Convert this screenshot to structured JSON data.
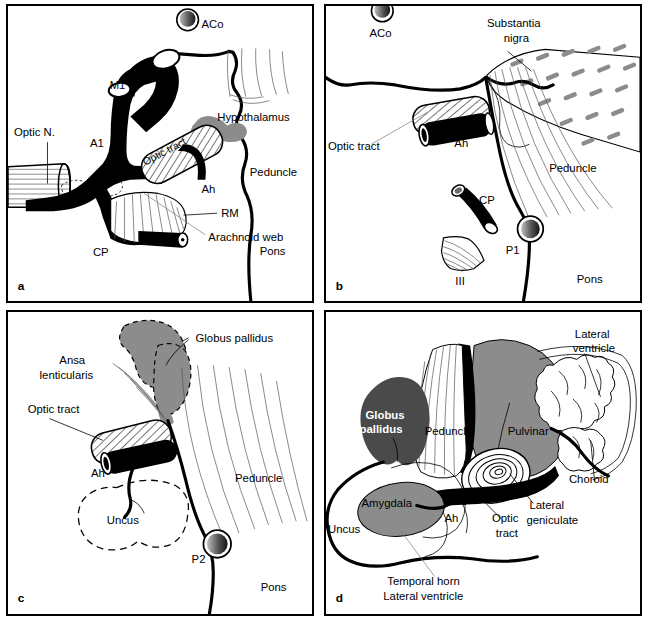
{
  "figure": {
    "type": "anatomical-line-diagram",
    "panel_count": 4,
    "colors": {
      "outline": "#000000",
      "gray_fill": "#8c8c8c",
      "dark_gray_fill": "#4a4a4a",
      "white_fill": "#ffffff",
      "background": "#ffffff"
    }
  },
  "panels": [
    {
      "letter": "a",
      "labels": [
        {
          "key": "aco",
          "text": "ACo"
        },
        {
          "key": "m1",
          "text": "M1"
        },
        {
          "key": "a1",
          "text": "A1"
        },
        {
          "key": "optic_n",
          "text": "Optic N."
        },
        {
          "key": "optic_tract",
          "text": "Optic tract"
        },
        {
          "key": "hypothalamus",
          "text": "Hypothalamus"
        },
        {
          "key": "ah",
          "text": "Ah"
        },
        {
          "key": "peduncle",
          "text": "Peduncle"
        },
        {
          "key": "rm",
          "text": "RM"
        },
        {
          "key": "arachnoid_web",
          "text": "Arachnoid web"
        },
        {
          "key": "cp",
          "text": "CP"
        },
        {
          "key": "pons",
          "text": "Pons"
        }
      ]
    },
    {
      "letter": "b",
      "labels": [
        {
          "key": "aco",
          "text": "ACo"
        },
        {
          "key": "substantia_nigra",
          "text": "Substantia\nnigra"
        },
        {
          "key": "substantia_l1",
          "text": "Substantia"
        },
        {
          "key": "substantia_l2",
          "text": "nigra"
        },
        {
          "key": "optic_tract",
          "text": "Optic tract"
        },
        {
          "key": "ah",
          "text": "Ah"
        },
        {
          "key": "peduncle",
          "text": "Peduncle"
        },
        {
          "key": "cp",
          "text": "CP"
        },
        {
          "key": "p1",
          "text": "P1"
        },
        {
          "key": "iii",
          "text": "III"
        },
        {
          "key": "pons",
          "text": "Pons"
        }
      ]
    },
    {
      "letter": "c",
      "labels": [
        {
          "key": "globus_pallidus",
          "text": "Globus pallidus"
        },
        {
          "key": "ansa_l1",
          "text": "Ansa"
        },
        {
          "key": "ansa_l2",
          "text": "lenticularis"
        },
        {
          "key": "optic_tract",
          "text": "Optic tract"
        },
        {
          "key": "ah",
          "text": "Ah"
        },
        {
          "key": "uncus",
          "text": "Uncus"
        },
        {
          "key": "peduncle",
          "text": "Peduncle"
        },
        {
          "key": "p2",
          "text": "P2"
        },
        {
          "key": "pons",
          "text": "Pons"
        }
      ]
    },
    {
      "letter": "d",
      "labels": [
        {
          "key": "globus_l1",
          "text": "Globus"
        },
        {
          "key": "globus_l2",
          "text": "pallidus"
        },
        {
          "key": "peduncle",
          "text": "Peduncle"
        },
        {
          "key": "pulvinar",
          "text": "Pulvinar"
        },
        {
          "key": "lat_vent_l1",
          "text": "Lateral"
        },
        {
          "key": "lat_vent_l2",
          "text": "ventricle"
        },
        {
          "key": "choroid",
          "text": "Choroid"
        },
        {
          "key": "lat_gen_l1",
          "text": "Lateral"
        },
        {
          "key": "lat_gen_l2",
          "text": "geniculate"
        },
        {
          "key": "optic_l1",
          "text": "Optic"
        },
        {
          "key": "optic_l2",
          "text": "tract"
        },
        {
          "key": "amygdala",
          "text": "Amygdala"
        },
        {
          "key": "ah",
          "text": "Ah"
        },
        {
          "key": "uncus",
          "text": "Uncus"
        },
        {
          "key": "temporal_l1",
          "text": "Temporal horn"
        },
        {
          "key": "temporal_l2",
          "text": "Lateral ventricle"
        }
      ]
    }
  ]
}
